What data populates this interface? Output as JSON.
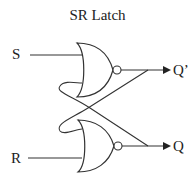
{
  "title": "SR Latch",
  "inputs": {
    "s_label": "S",
    "r_label": "R"
  },
  "outputs": {
    "q_prime_label": "Q’",
    "q_label": "Q"
  },
  "gates": [
    {
      "type": "NOR",
      "position": "top",
      "inputs": [
        "S",
        "Q"
      ],
      "output": "Q’"
    },
    {
      "type": "NOR",
      "position": "bottom",
      "inputs": [
        "Q’",
        "R"
      ],
      "output": "Q"
    }
  ],
  "colors": {
    "stroke": "#333333",
    "background": "#ffffff"
  }
}
